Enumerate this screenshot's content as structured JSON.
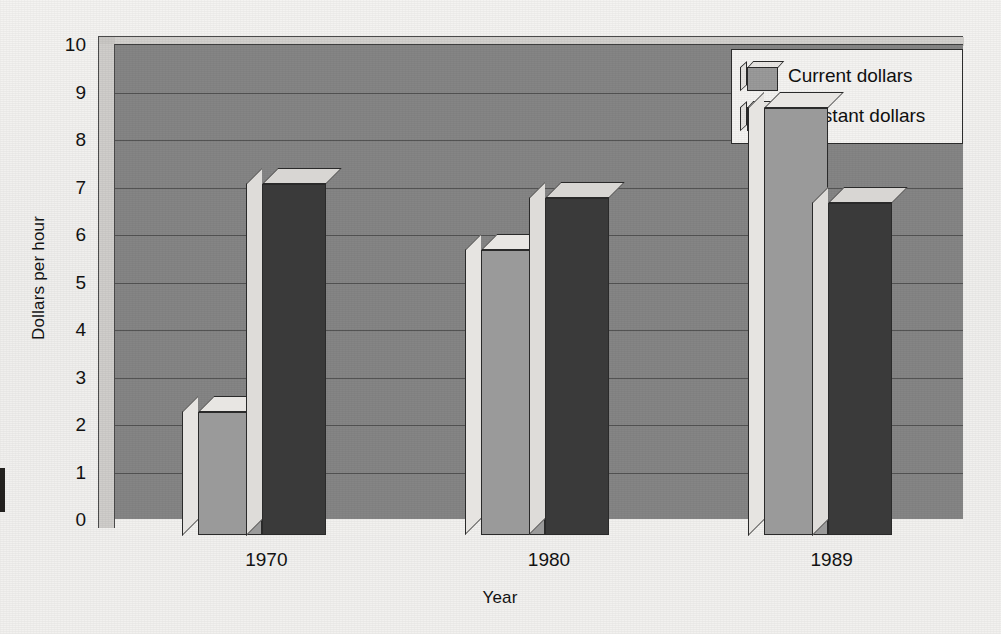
{
  "chart_data": {
    "type": "bar",
    "title": "",
    "subtitle": "",
    "xlabel": "Year",
    "ylabel": "Dollars per hour",
    "categories": [
      "1970",
      "1980",
      "1989"
    ],
    "series": [
      {
        "name": "Current dollars",
        "color": "#9a9a9a",
        "values": [
          2.6,
          6.0,
          9.0
        ]
      },
      {
        "name": "Constant dollars",
        "color": "#3a3a3a",
        "values": [
          7.4,
          7.1,
          7.0
        ]
      }
    ],
    "ylim": [
      0,
      10
    ],
    "ytick_values": [
      0,
      1,
      2,
      3,
      4,
      5,
      6,
      7,
      8,
      9,
      10
    ],
    "ytick_labels": [
      "0",
      "1",
      "2",
      "3",
      "4",
      "5",
      "6",
      "7",
      "8",
      "9",
      "10"
    ],
    "grid": true,
    "grid_axis": "y",
    "legend_position": "top-right-inside",
    "style": "3d-grouped-bars-grayscale",
    "plot_background": "#858585",
    "page_background": "#f2f1ef"
  },
  "legend": {
    "entries": [
      {
        "label": "Current dollars",
        "icon": "cube-swatch-light"
      },
      {
        "label": "Constant dollars",
        "icon": "cube-swatch-dark"
      }
    ]
  },
  "axes": {
    "y_title": "Dollars per hour",
    "x_title": "Year",
    "y_ticks": [
      "10",
      "9",
      "8",
      "7",
      "6",
      "5",
      "4",
      "3",
      "2",
      "1",
      "0"
    ],
    "x_ticks": [
      "1970",
      "1980",
      "1989"
    ]
  }
}
